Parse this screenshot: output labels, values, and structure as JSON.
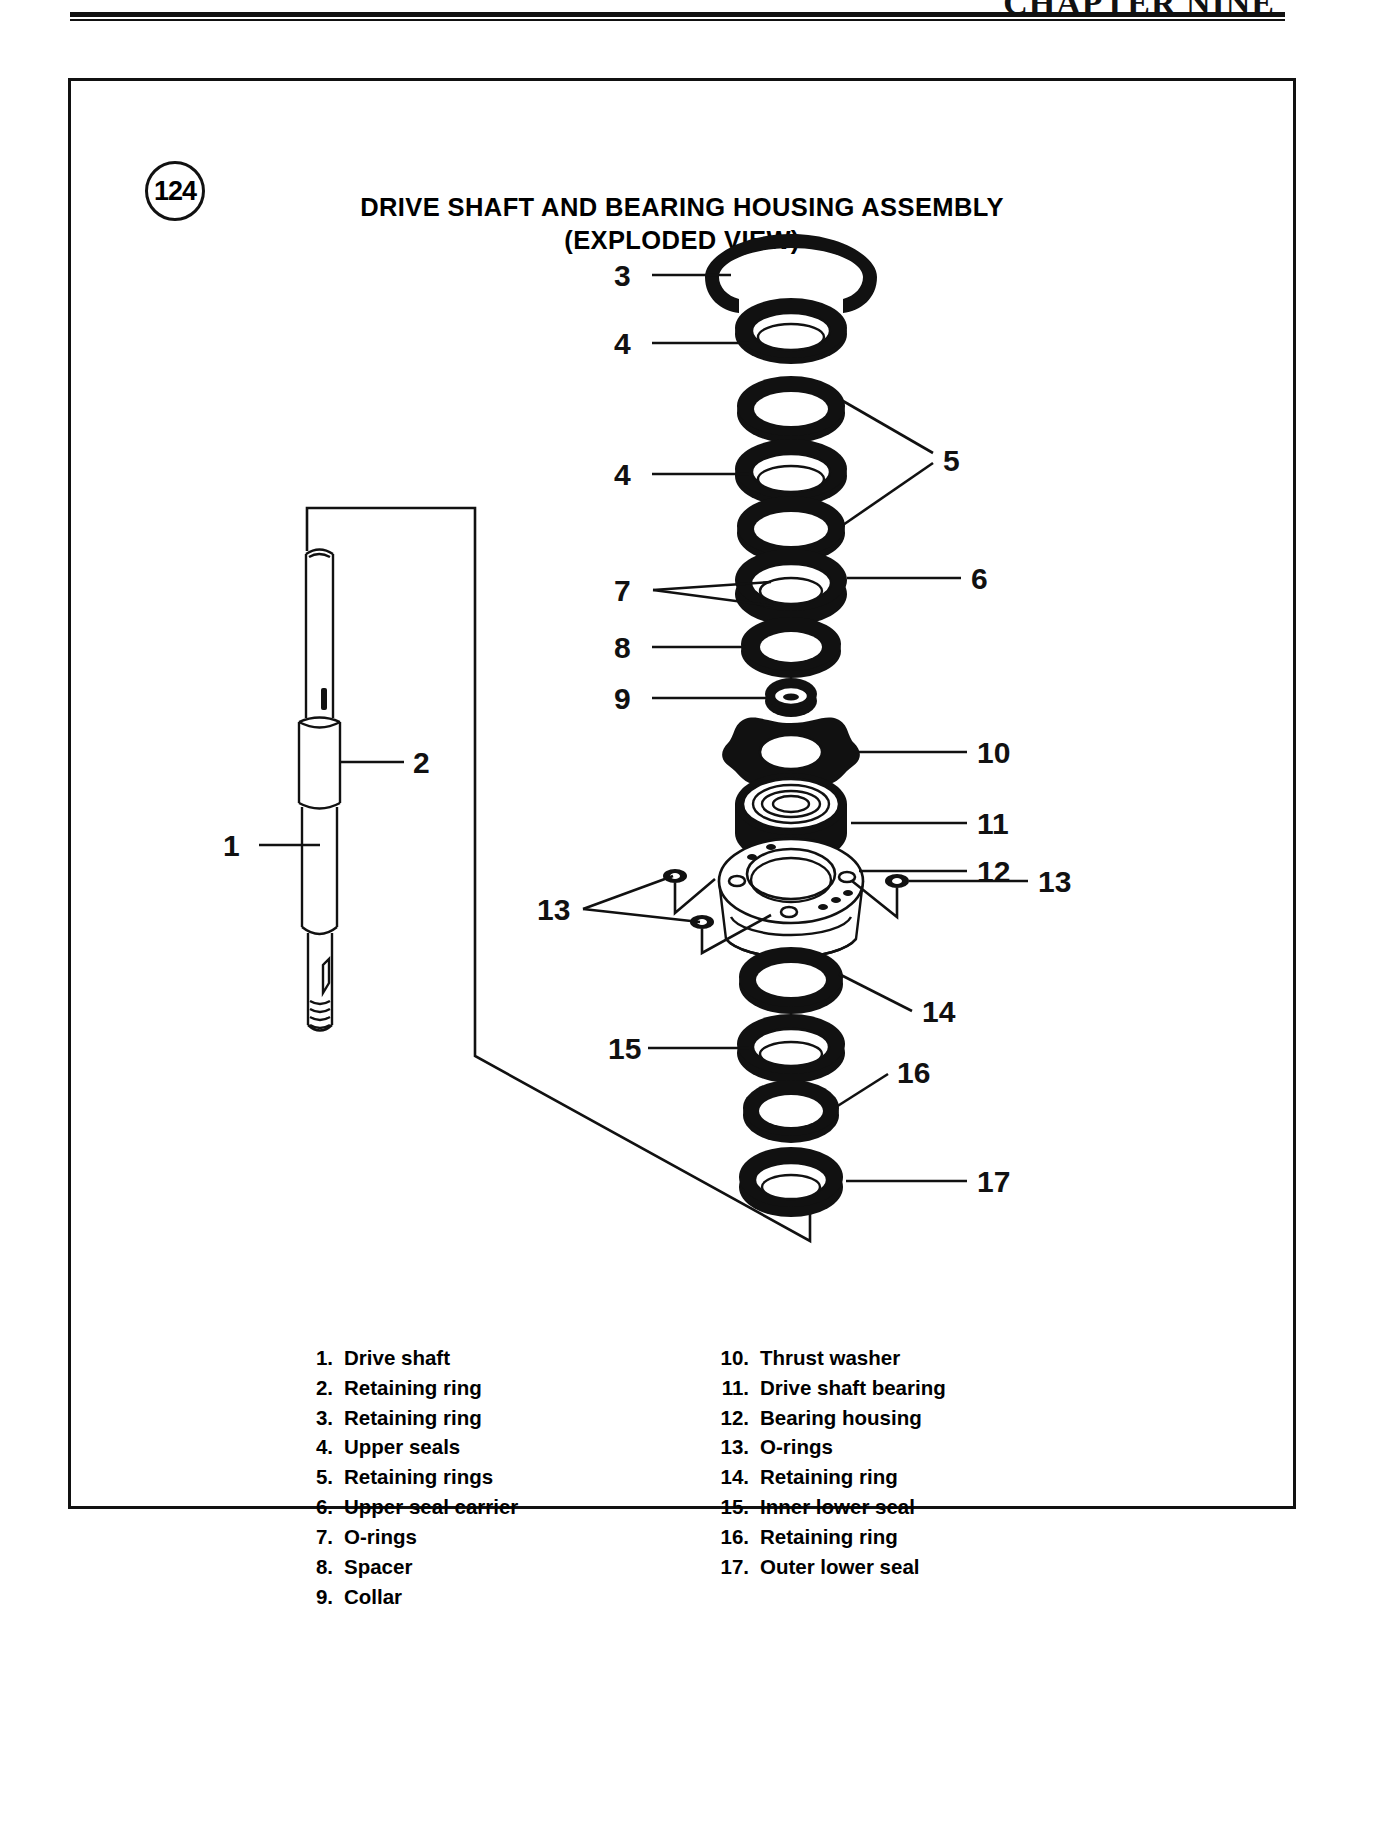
{
  "page": {
    "chapter_header": "CHAPTER NINE",
    "figure_number": "124"
  },
  "figure": {
    "title_line1": "DRIVE SHAFT AND BEARING HOUSING ASSEMBLY",
    "title_line2": "(EXPLODED VIEW)"
  },
  "callouts": [
    {
      "id": "c1",
      "number": "1"
    },
    {
      "id": "c2",
      "number": "2"
    },
    {
      "id": "c3",
      "number": "3"
    },
    {
      "id": "c4a",
      "number": "4"
    },
    {
      "id": "c4b",
      "number": "4"
    },
    {
      "id": "c5",
      "number": "5"
    },
    {
      "id": "c6",
      "number": "6"
    },
    {
      "id": "c7",
      "number": "7"
    },
    {
      "id": "c8",
      "number": "8"
    },
    {
      "id": "c9",
      "number": "9"
    },
    {
      "id": "c10",
      "number": "10"
    },
    {
      "id": "c11",
      "number": "11"
    },
    {
      "id": "c12",
      "number": "12"
    },
    {
      "id": "c13a",
      "number": "13"
    },
    {
      "id": "c13b",
      "number": "13"
    },
    {
      "id": "c14",
      "number": "14"
    },
    {
      "id": "c15",
      "number": "15"
    },
    {
      "id": "c16",
      "number": "16"
    },
    {
      "id": "c17",
      "number": "17"
    }
  ],
  "legend": {
    "left": [
      {
        "num": "1.",
        "label": "Drive shaft"
      },
      {
        "num": "2.",
        "label": "Retaining ring"
      },
      {
        "num": "3.",
        "label": "Retaining ring"
      },
      {
        "num": "4.",
        "label": "Upper seals"
      },
      {
        "num": "5.",
        "label": "Retaining rings"
      },
      {
        "num": "6.",
        "label": "Upper seal carrier"
      },
      {
        "num": "7.",
        "label": "O-rings"
      },
      {
        "num": "8.",
        "label": "Spacer"
      },
      {
        "num": "9.",
        "label": "Collar"
      }
    ],
    "right": [
      {
        "num": "10.",
        "label": "Thrust washer"
      },
      {
        "num": "11.",
        "label": "Drive shaft bearing"
      },
      {
        "num": "12.",
        "label": "Bearing housing"
      },
      {
        "num": "13.",
        "label": "O-rings"
      },
      {
        "num": "14.",
        "label": "Retaining ring"
      },
      {
        "num": "15.",
        "label": "Inner lower seal"
      },
      {
        "num": "16.",
        "label": "Retaining ring"
      },
      {
        "num": "17.",
        "label": "Outer lower seal"
      }
    ]
  },
  "colors": {
    "ink": "#111111",
    "paper": "#ffffff"
  }
}
